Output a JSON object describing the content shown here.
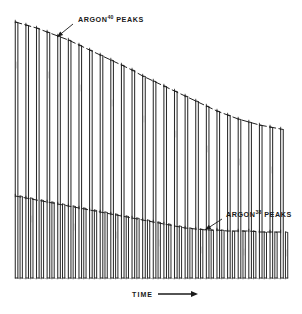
{
  "figure": {
    "title": "",
    "background_color": "#ffffff",
    "trace_color": "#2b2b2b",
    "envelope_color": "#1f1f1f"
  },
  "annotations": {
    "argon40": {
      "text_main": "ARGON",
      "text_sup": "40",
      "text_tail": " PEAKS",
      "full": "ARGON40 PEAKS",
      "x": 78,
      "y": 22,
      "leader_from_x": 73,
      "leader_from_y": 24,
      "leader_to_x": 57,
      "leader_to_y": 37
    },
    "argon38": {
      "text_main": "ARGON",
      "text_sup": "38",
      "text_tail": " PEAKS",
      "full": "ARGON38 PEAKS",
      "x": 226,
      "y": 217,
      "leader_from_x": 222,
      "leader_from_y": 219,
      "leader_to_x": 205,
      "leader_to_y": 230
    }
  },
  "axis": {
    "time_label": "TIME",
    "arrow_name": "right-arrow",
    "x": 132,
    "y": 297,
    "arrow_x1": 158,
    "arrow_x2": 198,
    "arrow_y": 294
  },
  "chart_data": {
    "type": "line",
    "xlabel": "TIME",
    "ylabel": "",
    "grid": false,
    "legend": "none",
    "x": [
      1,
      2,
      3,
      4,
      5,
      6,
      7,
      8,
      9,
      10,
      11,
      12,
      13,
      14,
      15,
      16,
      17,
      18,
      19,
      20,
      21,
      22,
      23,
      24,
      25,
      26
    ],
    "series": [
      {
        "name": "ARGON40 PEAKS",
        "role": "tall-peaks",
        "description": "Tall peaks whose tops trace a downward-sloping decay envelope from upper-left to mid-right",
        "peak_top_y_px": [
          22,
          25,
          28,
          32,
          36,
          40,
          45,
          50,
          55,
          60,
          65,
          70,
          76,
          81,
          86,
          91,
          96,
          101,
          106,
          111,
          115,
          119,
          122,
          125,
          127,
          129
        ],
        "peak_base_y_px": 278,
        "envelope_start": {
          "x": 14,
          "y": 22
        },
        "envelope_end": {
          "x": 288,
          "y": 130
        }
      },
      {
        "name": "ARGON38 PEAKS",
        "role": "short-peaks",
        "description": "Shorter peaks interleaved between the tall ones; tops trace a shallower decay envelope",
        "peak_top_y_px": [
          196,
          198,
          200,
          202,
          204,
          206,
          208,
          210,
          212,
          214,
          216,
          218,
          220,
          222,
          224,
          226,
          228,
          229,
          230,
          230,
          231,
          231,
          231,
          232,
          232,
          232
        ],
        "peak_base_y_px": 278,
        "envelope_start": {
          "x": 14,
          "y": 196
        },
        "envelope_end": {
          "x": 288,
          "y": 232
        }
      }
    ],
    "axis_ranges": {
      "x_px": [
        14,
        290
      ],
      "y_px": [
        18,
        282
      ]
    }
  }
}
